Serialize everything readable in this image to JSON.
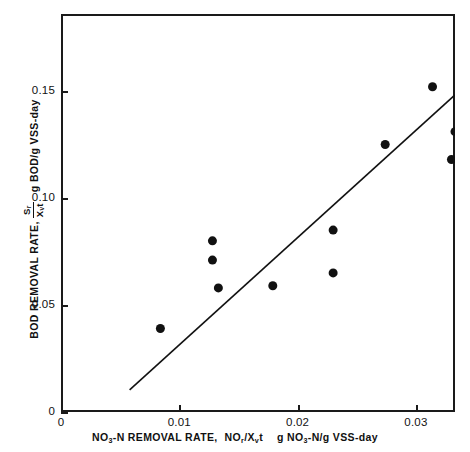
{
  "chart_data": {
    "type": "scatter",
    "title": "",
    "xlabel": "NO3-N REMOVAL RATE, NOr/Xvt  g NO3-N/g VSS-day",
    "ylabel": "BOD REMOVAL RATE, Sr/Xvt  g BOD/g VSS-day",
    "xlim": [
      0,
      0.0333
    ],
    "ylim": [
      0,
      0.186
    ],
    "grid": false,
    "legend": null,
    "x_ticks": [
      0,
      0.01,
      0.02,
      0.03
    ],
    "x_tick_labels": [
      "0",
      "0.01",
      "0.02",
      "0.03"
    ],
    "y_ticks": [
      0,
      0.05,
      0.1,
      0.15
    ],
    "y_tick_labels": [
      "0",
      "0.05",
      "0.10",
      "0.15"
    ],
    "marker": "filled-circle",
    "marker_color": "#111111",
    "marker_size_px": 9,
    "x": [
      0.0084,
      0.0128,
      0.0128,
      0.0133,
      0.0179,
      0.023,
      0.023,
      0.0274,
      0.0314,
      0.0333,
      0.033
    ],
    "y": [
      0.039,
      0.08,
      0.071,
      0.058,
      0.059,
      0.085,
      0.065,
      0.125,
      0.152,
      0.131,
      0.118
    ],
    "points": [
      {
        "x": 0.0084,
        "y": 0.039
      },
      {
        "x": 0.0128,
        "y": 0.08
      },
      {
        "x": 0.0128,
        "y": 0.071
      },
      {
        "x": 0.0133,
        "y": 0.058
      },
      {
        "x": 0.0179,
        "y": 0.059
      },
      {
        "x": 0.023,
        "y": 0.085
      },
      {
        "x": 0.023,
        "y": 0.065
      },
      {
        "x": 0.0274,
        "y": 0.125
      },
      {
        "x": 0.0314,
        "y": 0.152
      },
      {
        "x": 0.0333,
        "y": 0.131
      },
      {
        "x": 0.033,
        "y": 0.118
      }
    ],
    "fit_line": {
      "type": "line",
      "color": "#111111",
      "width_px": 1.6,
      "x_start": 0.0058,
      "y_start": 0.0103,
      "x_end": 0.0333,
      "y_end": 0.1482
    }
  },
  "axes": {
    "x": {
      "title_parts": {
        "species": "NO",
        "species_sub": "3",
        "species_tail": "-N REMOVAL RATE,",
        "ratio_num": "NO",
        "ratio_num_sub": "r",
        "ratio_slash": "/X",
        "ratio_den_sub": "v",
        "ratio_tail": "t",
        "units_lead": "g NO",
        "units_sub": "3",
        "units_tail": "-N/g VSS-day"
      },
      "tick_labels": [
        "0",
        "0.01",
        "0.02",
        "0.03"
      ]
    },
    "y": {
      "title_parts": {
        "lead": "BOD REMOVAL RATE,",
        "frac_numerator": "S",
        "frac_numerator_sub": "r",
        "frac_denominator": "X",
        "frac_denominator_sub": "v",
        "frac_denominator_tail": "t",
        "units": "g BOD/g VSS-day"
      },
      "tick_labels": [
        "0",
        "0.05",
        "0.10",
        "0.15"
      ]
    }
  },
  "style": {
    "frame_color": "#1a1a1a",
    "background": "#ffffff",
    "text_color": "#111111"
  }
}
